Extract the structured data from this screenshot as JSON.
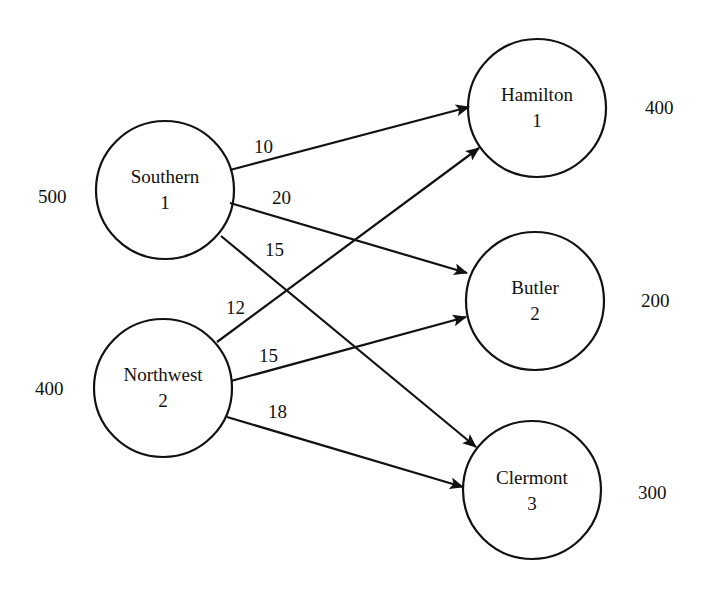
{
  "diagram": {
    "type": "transportation-network",
    "sources": [
      {
        "id": "southern",
        "name": "Southern",
        "index": "1",
        "supply": "500"
      },
      {
        "id": "northwest",
        "name": "Northwest",
        "index": "2",
        "supply": "400"
      }
    ],
    "destinations": [
      {
        "id": "hamilton",
        "name": "Hamilton",
        "index": "1",
        "demand": "400"
      },
      {
        "id": "butler",
        "name": "Butler",
        "index": "2",
        "demand": "200"
      },
      {
        "id": "clermont",
        "name": "Clermont",
        "index": "3",
        "demand": "300"
      }
    ],
    "edges": [
      {
        "from": "southern",
        "to": "hamilton",
        "cost": "10"
      },
      {
        "from": "southern",
        "to": "butler",
        "cost": "20"
      },
      {
        "from": "southern",
        "to": "clermont",
        "cost": "15"
      },
      {
        "from": "northwest",
        "to": "hamilton",
        "cost": "12"
      },
      {
        "from": "northwest",
        "to": "butler",
        "cost": "15"
      },
      {
        "from": "northwest",
        "to": "clermont",
        "cost": "18"
      }
    ],
    "colors": {
      "stroke": "#111111",
      "background": "#ffffff"
    }
  }
}
